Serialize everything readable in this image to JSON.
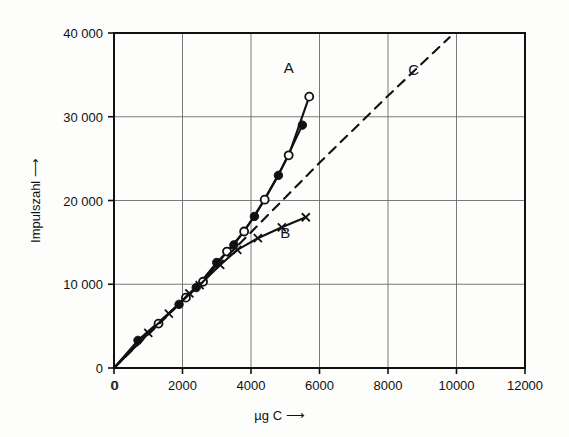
{
  "chart_data": {
    "type": "line",
    "title": "",
    "xlabel": "µg C ⟶",
    "ylabel": "Impulszahl ⟶",
    "xlabel_plain": "µg C",
    "ylabel_plain": "Impulszahl",
    "xlim": [
      0,
      12000
    ],
    "ylim": [
      0,
      40000
    ],
    "xticks": [
      0,
      2000,
      4000,
      6000,
      8000,
      10000,
      12000
    ],
    "yticks": [
      0,
      10000,
      20000,
      30000,
      40000
    ],
    "xtick_labels": [
      "0",
      "2000",
      "4000",
      "6000",
      "8000",
      "10000",
      "12000"
    ],
    "ytick_labels": [
      "0",
      "10 000",
      "20 000",
      "30 000",
      "40 000"
    ],
    "grid": true,
    "grid_color": "#6b6b6b",
    "axis_color": "#111111",
    "legend": "none",
    "annotations": [
      {
        "text": "A",
        "x": 5100,
        "y": 35200
      },
      {
        "text": "B",
        "x": 5000,
        "y": 15500
      },
      {
        "text": "C",
        "x": 8750,
        "y": 35000
      }
    ],
    "series": [
      {
        "name": "A",
        "label": "A",
        "marker": "filled-circle",
        "linestyle": "solid",
        "color": "#111111",
        "points": [
          {
            "x": 0,
            "y": 0
          },
          {
            "x": 700,
            "y": 3300
          },
          {
            "x": 1900,
            "y": 7600
          },
          {
            "x": 2400,
            "y": 9600
          },
          {
            "x": 3000,
            "y": 12600
          },
          {
            "x": 3500,
            "y": 14700
          },
          {
            "x": 4100,
            "y": 18100
          },
          {
            "x": 4800,
            "y": 23000
          },
          {
            "x": 5500,
            "y": 29000
          }
        ]
      },
      {
        "name": "A-open",
        "label": "A",
        "marker": "open-circle",
        "linestyle": "solid",
        "color": "#111111",
        "points": [
          {
            "x": 0,
            "y": 0
          },
          {
            "x": 1300,
            "y": 5300
          },
          {
            "x": 2100,
            "y": 8400
          },
          {
            "x": 2600,
            "y": 10300
          },
          {
            "x": 3300,
            "y": 13900
          },
          {
            "x": 3800,
            "y": 16300
          },
          {
            "x": 4400,
            "y": 20100
          },
          {
            "x": 5100,
            "y": 25400
          },
          {
            "x": 5700,
            "y": 32400
          }
        ]
      },
      {
        "name": "B",
        "label": "B",
        "marker": "cross",
        "linestyle": "solid",
        "color": "#111111",
        "points": [
          {
            "x": 0,
            "y": 0
          },
          {
            "x": 1000,
            "y": 4200
          },
          {
            "x": 1600,
            "y": 6500
          },
          {
            "x": 2200,
            "y": 8900
          },
          {
            "x": 2500,
            "y": 9900
          },
          {
            "x": 3100,
            "y": 12300
          },
          {
            "x": 3600,
            "y": 14100
          },
          {
            "x": 4200,
            "y": 15500
          },
          {
            "x": 4900,
            "y": 16800
          },
          {
            "x": 5600,
            "y": 18000
          }
        ]
      },
      {
        "name": "C",
        "label": "C",
        "marker": "none",
        "linestyle": "dashed",
        "color": "#111111",
        "points": [
          {
            "x": 0,
            "y": 0
          },
          {
            "x": 2000,
            "y": 8000
          },
          {
            "x": 4000,
            "y": 16200
          },
          {
            "x": 6000,
            "y": 24500
          },
          {
            "x": 8000,
            "y": 32500
          },
          {
            "x": 9800,
            "y": 39500
          }
        ]
      }
    ]
  }
}
